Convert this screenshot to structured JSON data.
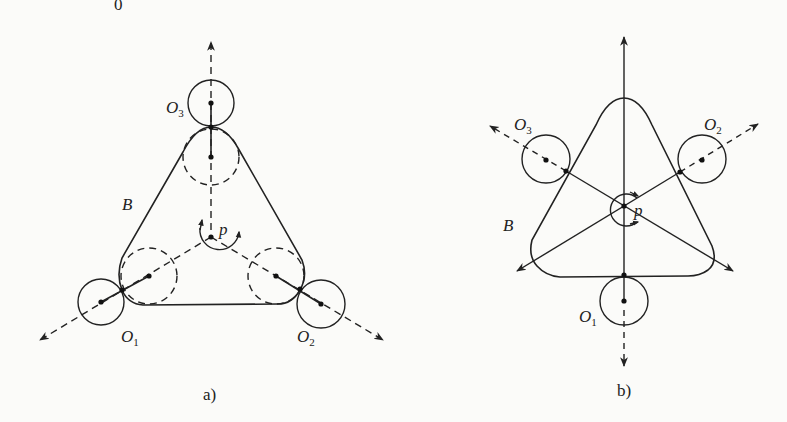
{
  "figure": {
    "header_fragment": "0",
    "panels": [
      {
        "id": "a",
        "caption": "a)",
        "labels": {
          "o1": {
            "main": "O",
            "sub": "1"
          },
          "o2": {
            "main": "O",
            "sub": "2"
          },
          "o3": {
            "main": "O",
            "sub": "3"
          },
          "belt": "B",
          "pivot": "p"
        }
      },
      {
        "id": "b",
        "caption": "b)",
        "labels": {
          "o1": {
            "main": "O",
            "sub": "1"
          },
          "o2": {
            "main": "O",
            "sub": "2"
          },
          "o3": {
            "main": "O",
            "sub": "3"
          },
          "belt": "B",
          "pivot": "p"
        }
      }
    ],
    "colors": {
      "line": "#222222",
      "background": "#fbfbf9"
    }
  }
}
